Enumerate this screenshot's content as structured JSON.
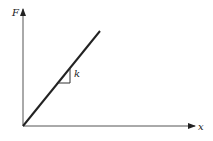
{
  "diagram": {
    "y_axis_label": "F",
    "x_axis_label": "x",
    "slope_label": "k",
    "colors": {
      "stroke": "#222222",
      "background": "#ffffff"
    }
  }
}
